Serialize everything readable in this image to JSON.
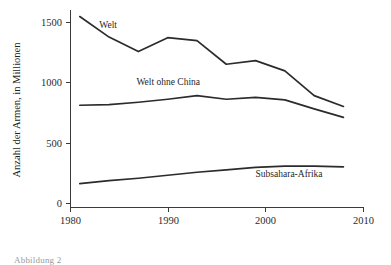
{
  "figure": {
    "caption_partial": "Abbildung 2"
  },
  "chart_data": {
    "type": "line",
    "title": "",
    "xlabel": "",
    "ylabel": "Anzahl der Armen, in Millionen",
    "xlim": [
      1980,
      2010
    ],
    "ylim": [
      0,
      1600
    ],
    "grid": false,
    "legend": "inline-labels",
    "xticks": [
      1980,
      1990,
      2000,
      2010
    ],
    "xtick_labels": [
      "1980",
      "1990",
      "2000",
      "2010"
    ],
    "yticks": [
      0,
      500,
      1000,
      1500
    ],
    "ytick_labels": [
      "0",
      "500",
      "1000",
      "1500"
    ],
    "series": [
      {
        "name": "Welt",
        "label": "Welt",
        "color": "#2b2b2b",
        "x": [
          1981,
          1984,
          1987,
          1990,
          1993,
          1996,
          1999,
          2002,
          2005,
          2008
        ],
        "values": [
          1545,
          1375,
          1255,
          1370,
          1345,
          1150,
          1180,
          1095,
          890,
          800
        ]
      },
      {
        "name": "Welt ohne China",
        "label": "Welt ohne China",
        "color": "#2b2b2b",
        "x": [
          1981,
          1984,
          1987,
          1990,
          1993,
          1996,
          1999,
          2002,
          2005,
          2008
        ],
        "values": [
          810,
          815,
          835,
          860,
          890,
          860,
          875,
          855,
          780,
          710
        ]
      },
      {
        "name": "Subsahara-Afrika",
        "label": "Subsahara-Afrika",
        "color": "#2b2b2b",
        "x": [
          1981,
          1984,
          1987,
          1990,
          1993,
          1996,
          1999,
          2002,
          2005,
          2008
        ],
        "values": [
          160,
          185,
          205,
          230,
          255,
          275,
          295,
          305,
          305,
          300
        ]
      }
    ],
    "series_label_positions": [
      {
        "name": "Welt",
        "x": 1983.0,
        "y": 1450
      },
      {
        "name": "Welt ohne China",
        "x": 1986.8,
        "y": 980
      },
      {
        "name": "Subsahara-Afrika",
        "x": 1999.0,
        "y": 215
      }
    ]
  }
}
